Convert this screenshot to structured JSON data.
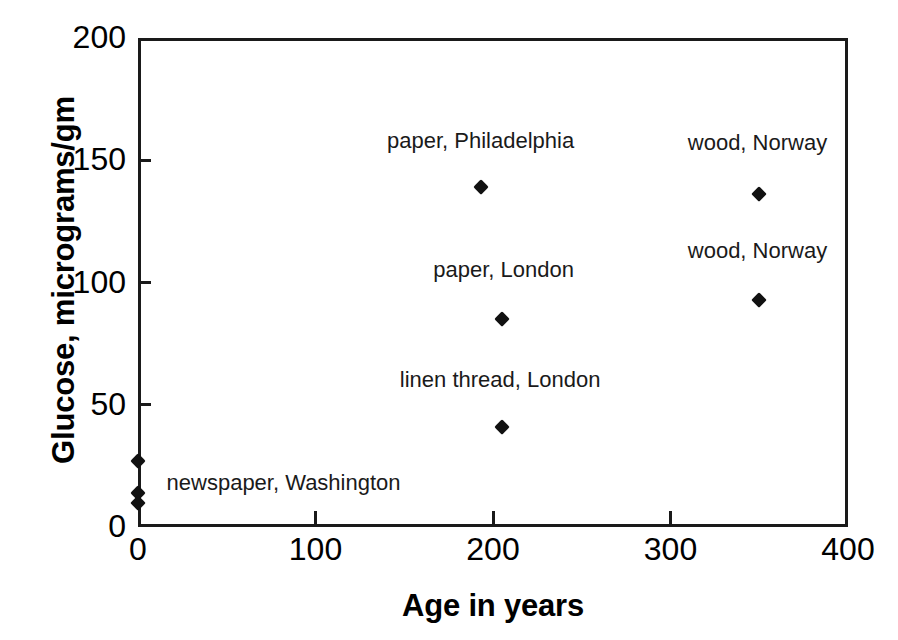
{
  "chart_data": {
    "type": "scatter",
    "title": "",
    "xlabel": "Age in years",
    "ylabel": "Glucose, micrograms/gm",
    "xlim": [
      0,
      400
    ],
    "ylim": [
      0,
      200
    ],
    "xticks": [
      0,
      100,
      200,
      300,
      400
    ],
    "yticks": [
      0,
      50,
      100,
      150,
      200
    ],
    "xtick_labels": [
      "0",
      "100",
      "200",
      "300",
      "400"
    ],
    "ytick_labels": [
      "0",
      "50",
      "100",
      "150",
      "200"
    ],
    "grid": false,
    "legend": false,
    "marker": "filled-diamond",
    "marker_color": "#111111",
    "points": [
      {
        "x": 0,
        "y": 27,
        "label": "newspaper, Washington"
      },
      {
        "x": 0,
        "y": 14,
        "label": ""
      },
      {
        "x": 0,
        "y": 10,
        "label": ""
      },
      {
        "x": 193,
        "y": 139,
        "label": "paper, Philadelphia"
      },
      {
        "x": 205,
        "y": 85,
        "label": "paper, London"
      },
      {
        "x": 205,
        "y": 41,
        "label": "linen thread, London"
      },
      {
        "x": 350,
        "y": 136,
        "label": "wood, Norway"
      },
      {
        "x": 350,
        "y": 93,
        "label": "wood, Norway"
      }
    ],
    "annotations": [
      {
        "text": "paper, Philadelphia",
        "x": 193,
        "y": 158
      },
      {
        "text": "wood, Norway",
        "x": 349,
        "y": 157
      },
      {
        "text": "paper, London",
        "x": 206,
        "y": 105
      },
      {
        "text": "wood, Norway",
        "x": 349,
        "y": 113
      },
      {
        "text": "linen thread, London",
        "x": 204,
        "y": 60
      },
      {
        "text": "newspaper, Washington",
        "x": 82,
        "y": 18
      }
    ]
  }
}
